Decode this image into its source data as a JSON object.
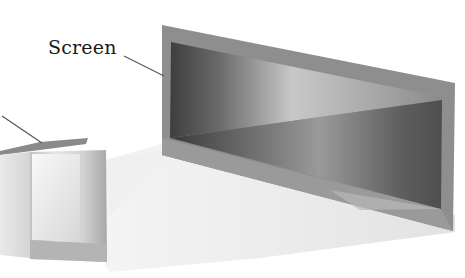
{
  "figure": {
    "type": "projection-diagram",
    "labels": [
      {
        "id": "screen",
        "text": "Screen"
      },
      {
        "id": "left-object",
        "text": ""
      }
    ]
  },
  "colors": {
    "background": "#ffffff",
    "screen_frame": "#8c8c8c",
    "screen_dark": "#4a4a4a",
    "screen_light": "#bdbdbd",
    "beam": "#ececec",
    "box_face": "#d6d6d6",
    "pointer": "#555555"
  }
}
